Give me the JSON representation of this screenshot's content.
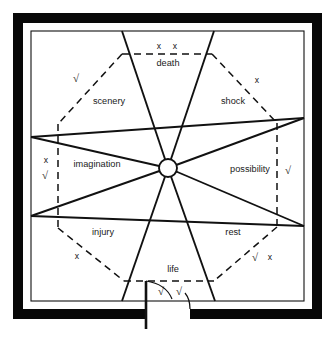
{
  "diagram": {
    "canvas": {
      "width": 334,
      "height": 343
    },
    "colors": {
      "wall": "#080808",
      "line": "#111111",
      "text": "#1a1a1a",
      "background": "#ffffff"
    },
    "center_hub": {
      "x": 168,
      "y": 168,
      "radius": 9
    },
    "zones": [
      {
        "id": "death",
        "label": "death",
        "position": "top",
        "label_x": 168,
        "label_y": 64,
        "marks": [
          {
            "symbol": "x",
            "x": 159,
            "y": 47
          },
          {
            "symbol": "x",
            "x": 175,
            "y": 47
          }
        ],
        "boundary": "dashed"
      },
      {
        "id": "scenery",
        "label": "scenery",
        "position": "top-left",
        "label_x": 109,
        "label_y": 102,
        "marks": [
          {
            "symbol": "√",
            "x": 76,
            "y": 79
          }
        ],
        "boundary": "dashed"
      },
      {
        "id": "shock",
        "label": "shock",
        "position": "top-right",
        "label_x": 233,
        "label_y": 102,
        "marks": [
          {
            "symbol": "x",
            "x": 257,
            "y": 81
          }
        ],
        "boundary": "dashed"
      },
      {
        "id": "imagination",
        "label": "imagination",
        "position": "left",
        "label_x": 97,
        "label_y": 165,
        "marks": [
          {
            "symbol": "x",
            "x": 46,
            "y": 162
          },
          {
            "symbol": "√",
            "x": 45,
            "y": 175
          }
        ],
        "boundary": "dashed"
      },
      {
        "id": "possibility",
        "label": "possibility",
        "position": "right",
        "label_x": 250,
        "label_y": 170,
        "marks": [
          {
            "symbol": "√",
            "x": 288,
            "y": 171
          }
        ],
        "boundary": "dashed"
      },
      {
        "id": "injury",
        "label": "injury",
        "position": "bottom-left",
        "label_x": 103,
        "label_y": 233,
        "marks": [
          {
            "symbol": "x",
            "x": 77,
            "y": 257
          }
        ],
        "boundary": "dashed"
      },
      {
        "id": "rest",
        "label": "rest",
        "position": "bottom-right",
        "label_x": 233,
        "label_y": 233,
        "marks": [
          {
            "symbol": "√",
            "x": 255,
            "y": 258
          },
          {
            "symbol": "x",
            "x": 270,
            "y": 258
          }
        ],
        "boundary": "dashed"
      },
      {
        "id": "life",
        "label": "life",
        "position": "bottom",
        "label_x": 173,
        "label_y": 270,
        "marks": [
          {
            "symbol": "√",
            "x": 161,
            "y": 292
          },
          {
            "symbol": "√",
            "x": 179,
            "y": 292
          }
        ],
        "boundary": "dashed"
      }
    ],
    "door": {
      "name": "entrance-door",
      "leaf_x": 146,
      "leaf_top": 281,
      "leaf_bottom": 329
    }
  }
}
